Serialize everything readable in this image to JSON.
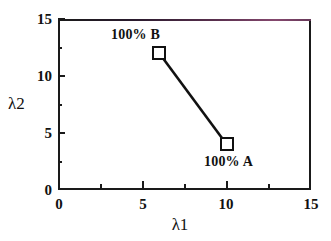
{
  "chart_data": {
    "type": "line",
    "title": "",
    "xlabel": "λ1",
    "ylabel": "λ2",
    "xlim": [
      0,
      15
    ],
    "ylim": [
      0,
      15
    ],
    "grid": false,
    "legend": "none",
    "marker": "open-square",
    "x_ticks": [
      "0",
      "5",
      "10",
      "15"
    ],
    "x_tick_values": [
      0,
      5,
      10,
      15
    ],
    "x_minor_ticks": [
      2.5,
      7.5,
      12.5
    ],
    "y_ticks": [
      "15",
      "10",
      "5",
      "0"
    ],
    "y_tick_values": [
      15,
      10,
      5,
      0
    ],
    "y_minor_ticks": [
      2.5,
      7.5,
      12.5
    ],
    "series": [
      {
        "name": "composition-line",
        "points": [
          {
            "x": 6,
            "y": 12,
            "label": "100%  B"
          },
          {
            "x": 10,
            "y": 4,
            "label": "100%  A"
          }
        ]
      }
    ],
    "annotations": [
      {
        "id": "b",
        "text": "100%  B",
        "x": 6,
        "y": 12
      },
      {
        "id": "a",
        "text": "100%  A",
        "x": 10,
        "y": 4
      }
    ],
    "colors": {
      "line": "#111111",
      "marker_edge": "#111111",
      "marker_face": "#ffffff",
      "axis": "#1a1a1a",
      "text": "#111111",
      "background": "#ffffff",
      "frame_top_tint": "#8a4a72"
    }
  }
}
